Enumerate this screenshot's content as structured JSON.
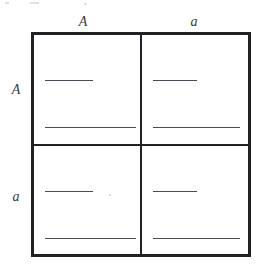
{
  "figure": {
    "type": "punnett-square",
    "title": "",
    "background_color": "#ffffff",
    "grid_border_color": "#222226",
    "line_color": "#4a4a52"
  },
  "headers": {
    "columns": [
      {
        "label": "A",
        "name": "column-header-A"
      },
      {
        "label": "a",
        "name": "column-header-a"
      }
    ],
    "rows": [
      {
        "label": "A",
        "name": "row-header-A"
      },
      {
        "label": "a",
        "name": "row-header-a"
      }
    ]
  },
  "cells": [
    {
      "id": "cell-AA",
      "row": "A",
      "column": "A",
      "genotype_line": "",
      "phenotype_line": ""
    },
    {
      "id": "cell-Aa",
      "row": "A",
      "column": "a",
      "genotype_line": "",
      "phenotype_line": ""
    },
    {
      "id": "cell-aA",
      "row": "a",
      "column": "A",
      "genotype_line": "",
      "phenotype_line": ""
    },
    {
      "id": "cell-aa",
      "row": "a",
      "column": "a",
      "genotype_line": "",
      "phenotype_line": ""
    }
  ]
}
